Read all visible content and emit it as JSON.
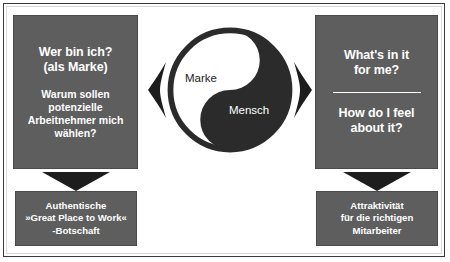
{
  "diagram": {
    "left_column": {
      "top_box": {
        "question_line1": "Wer bin ich?",
        "question_line2": "(als Marke)",
        "sub_line1": "Warum sollen",
        "sub_line2": "potenzielle",
        "sub_line3": "Arbeitnehmer mich",
        "sub_line4": "wählen?"
      },
      "arrow": "down-arrow",
      "bottom_box": {
        "line1": "Authentische",
        "line2": "»Great Place to Work«",
        "line3": "-Botschaft"
      }
    },
    "right_column": {
      "top_box": {
        "question1_line1": "What's in it",
        "question1_line2": "for me?",
        "question2_line1": "How do I feel",
        "question2_line2": "about it?"
      },
      "arrow": "down-arrow",
      "bottom_box": {
        "line1": "Attraktivität",
        "line2": "für die richtigen",
        "line3": "Mitarbeiter"
      }
    },
    "center": {
      "symbol": "yin-yang",
      "label_light": "Marke",
      "label_dark": "Mensch",
      "left_arrow": "arrow-left",
      "right_arrow": "arrow-right"
    },
    "colors": {
      "box_fill": "#5e5e5e",
      "box_text": "#ffffff",
      "arrow_fill": "#1d1d1d",
      "yin_dark": "#2b2b2b",
      "yin_light": "#ffffff",
      "background": "#ffffff",
      "frame_border": "#3a3a3a"
    }
  }
}
